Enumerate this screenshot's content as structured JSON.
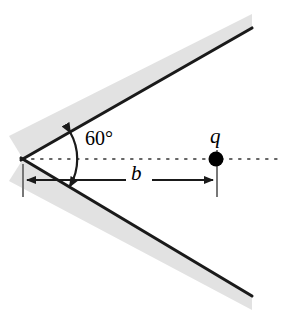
{
  "figure": {
    "kind": "physics-diagram",
    "background_color": "#ffffff",
    "line_color": "#1a1a1a",
    "hatch_band_color": "#e0e0e0",
    "dotted_line_color": "#555555",
    "labels": {
      "angle": "60°",
      "distance": "b",
      "charge": "q"
    },
    "geometry": {
      "vertex": {
        "x": 23,
        "y": 159
      },
      "upper_wall_end": {
        "x": 252,
        "y": 28
      },
      "lower_wall_end": {
        "x": 252,
        "y": 296
      },
      "bisector_start": {
        "x": 23,
        "y": 159
      },
      "bisector_end": {
        "x": 282,
        "y": 159
      },
      "charge_position": {
        "x": 216,
        "y": 159
      },
      "charge_dot_radius": 7,
      "dimension_line_y": 180,
      "dimension_left_x": 23,
      "dimension_right_x": 216,
      "angle_arc_radius": 52,
      "wedge_half_angle_degrees": 30,
      "wedge_full_angle_degrees": 60
    }
  }
}
